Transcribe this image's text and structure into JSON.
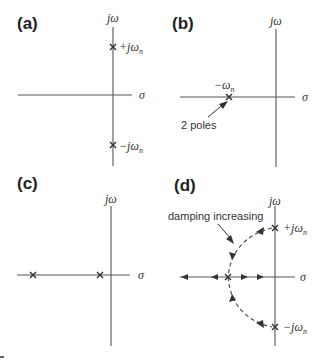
{
  "panels": {
    "a": {
      "label": "(a)",
      "imag_axis": "jω",
      "real_axis": "σ",
      "poles": [
        {
          "label_prefix": "+jω",
          "label_sub": "n"
        },
        {
          "label_prefix": "−jω",
          "label_sub": "n"
        }
      ]
    },
    "b": {
      "label": "(b)",
      "imag_axis": "jω",
      "real_axis": "σ",
      "pole_label_prefix": "−ω",
      "pole_label_sub": "n",
      "annotation": "2 poles"
    },
    "c": {
      "label": "(c)",
      "imag_axis": "jω",
      "real_axis": "σ"
    },
    "d": {
      "label": "(d)",
      "imag_axis": "jω",
      "real_axis": "σ",
      "annotation": "damping increasing",
      "poles": [
        {
          "label_prefix": "+jω",
          "label_sub": "n"
        },
        {
          "label_prefix": "−jω",
          "label_sub": "n"
        }
      ]
    }
  },
  "colors": {
    "ink": "#333333",
    "axis": "#555555",
    "background": "#ffffff"
  }
}
